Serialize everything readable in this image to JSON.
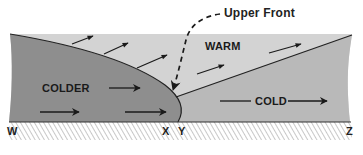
{
  "diagram": {
    "type": "cross-section",
    "annotation": {
      "upper_front": "Upper Front"
    },
    "air_masses": {
      "warm": "WARM",
      "colder": "COLDER",
      "cold": "COLD"
    },
    "ground_points": {
      "w": "W",
      "x": "X",
      "y": "Y",
      "z": "Z"
    },
    "colors": {
      "warm_fill": "#d3d3d3",
      "colder_fill": "#8e8e8e",
      "cold_fill": "#b9b9b9",
      "front_line": "#222222",
      "ground_hatch": "#9a9a9a",
      "text": "#1a1a1a"
    },
    "icons": {
      "wind_arrow": "arrow-right-icon",
      "upper_front_pointer": "dashed-curved-arrow-icon"
    }
  }
}
